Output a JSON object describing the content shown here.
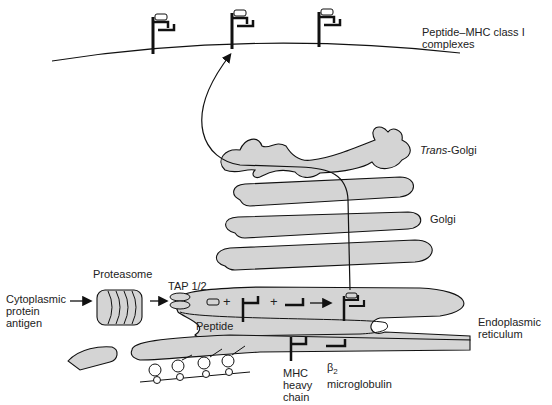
{
  "labels": {
    "complexes_line1": "Peptide–MHC class I",
    "complexes_line2": "complexes",
    "trans_golgi_italic": "Trans",
    "trans_golgi_rest": "-Golgi",
    "golgi": "Golgi",
    "cytoplasmic_line1": "Cytoplasmic",
    "cytoplasmic_line2": "protein",
    "cytoplasmic_line3": "antigen",
    "proteasome": "Proteasome",
    "tap": "TAP 1/2",
    "peptide": "Peptide",
    "er_line1": "Endoplasmic",
    "er_line2": "reticulum",
    "mhc_line1": "MHC",
    "mhc_line2": "heavy",
    "mhc_line3": "chain",
    "beta": "β",
    "beta_sub": "2",
    "microglobulin": "microglobulin"
  },
  "symbols": {
    "plus1": "+",
    "plus2": "+"
  },
  "colors": {
    "organelle_fill": "#d4d4d4",
    "stroke": "#111111",
    "background": "#ffffff"
  }
}
